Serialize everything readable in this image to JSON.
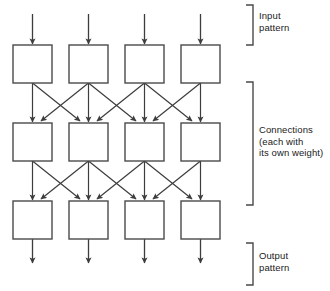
{
  "diagram": {
    "stroke_color": "#404040",
    "box_fill": "#ffffff",
    "text_color": "#1a1a1a",
    "columns": 4,
    "rows": 3,
    "geometry": {
      "column_x": [
        13,
        69,
        125,
        181
      ],
      "box_width": 39,
      "box_height": 38,
      "row_y": [
        45,
        123,
        201
      ],
      "input_arrow_top": 14,
      "output_arrow_bottom": 264
    },
    "layers": [
      {
        "name": "input-layer",
        "row": 0,
        "node_count": 4
      },
      {
        "name": "hidden-layer",
        "row": 1,
        "node_count": 4
      },
      {
        "name": "output-layer",
        "row": 2,
        "node_count": 4
      }
    ],
    "connection_pattern": "each node sends a vertical arrow to the node below it and diagonal arrows to its immediate left and right neighbours in the next row"
  },
  "brackets": [
    {
      "name": "input-bracket",
      "label_lines": "Input\npattern",
      "label_text": "Input pattern",
      "top": 5,
      "bottom": 45
    },
    {
      "name": "connections-bracket",
      "label_lines": "Connections\n(each with\nits own weight)",
      "label_text": "Connections (each with its own weight)",
      "top": 82,
      "bottom": 205
    },
    {
      "name": "output-bracket",
      "label_lines": "Output\npattern",
      "label_text": "Output pattern",
      "top": 243,
      "bottom": 285
    }
  ]
}
